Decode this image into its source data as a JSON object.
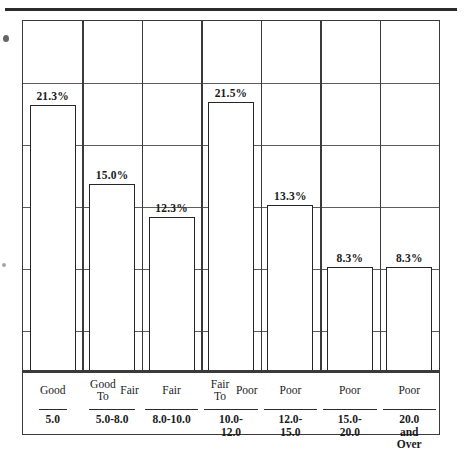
{
  "figure": {
    "has_top_rule": true,
    "frame_border_color": "#3a3a3a",
    "bar_outline_color": "#262626",
    "bar_fill_color": "#ffffff",
    "gridline_color": "#5d5d5d"
  },
  "chart_data": {
    "type": "bar",
    "title": "",
    "subtitle": "",
    "xlabel": "",
    "ylabel": "",
    "grid": true,
    "legend": "none",
    "ylim": [
      0,
      28
    ],
    "gridline_count": 5,
    "categories": [
      "Good",
      "Good To Fair",
      "Fair",
      "Fair To Poor",
      "Poor",
      "Poor",
      "Poor"
    ],
    "category_lines": [
      [
        "Good"
      ],
      [
        "Good To",
        "Fair"
      ],
      [
        "Fair"
      ],
      [
        "Fair To",
        "Poor"
      ],
      [
        "Poor"
      ],
      [
        "Poor"
      ],
      [
        "Poor"
      ]
    ],
    "ranges": [
      "5.0",
      "5.0-8.0",
      "8.0-10.0",
      "10.0-12.0",
      "12.0-15.0",
      "15.0-20.0",
      "20.0 and\nOver"
    ],
    "values": [
      21.3,
      15.0,
      12.3,
      21.5,
      13.3,
      8.3,
      8.3
    ],
    "value_labels": [
      "21.3%",
      "15.0%",
      "12.3%",
      "21.5%",
      "13.3%",
      "8.3%",
      "8.3%"
    ]
  }
}
